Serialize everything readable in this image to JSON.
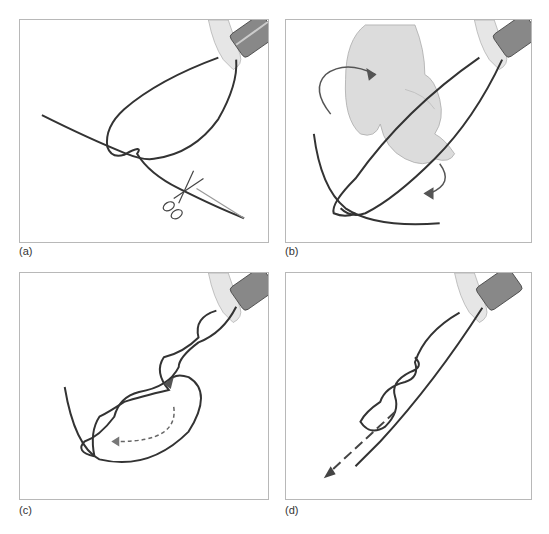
{
  "figure": {
    "colors": {
      "suture": "#333333",
      "border": "#b8b8b8",
      "hand": "#d9d9d9",
      "arrow": "#555555",
      "background": "#ffffff"
    },
    "panels": [
      {
        "id": "a",
        "label": "(a)",
        "depicts": "Suture loop held by needle holder, single knot throw; scissors cutting tail"
      },
      {
        "id": "b",
        "label": "(b)",
        "depicts": "Hand rotating (curved arrows) to wrap suture strand around needle holder"
      },
      {
        "id": "c",
        "label": "(c)",
        "depicts": "Twisted suture strands with solid and dashed direction arrows"
      },
      {
        "id": "d",
        "label": "(d)",
        "depicts": "Knot being tightened; dashed arrow pulling strand down-left"
      }
    ]
  }
}
